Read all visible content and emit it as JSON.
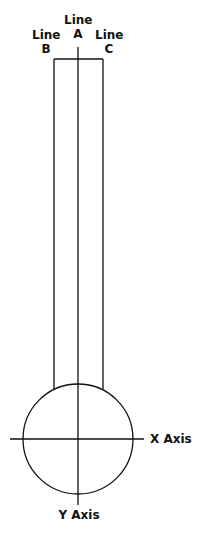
{
  "diagram": {
    "labels": {
      "line_a": {
        "line1": "Line",
        "line2": "A"
      },
      "line_b": {
        "line1": "Line",
        "line2": "B"
      },
      "line_c": {
        "line1": "Line",
        "line2": "C"
      },
      "x_axis": "X Axis",
      "y_axis": "Y Axis"
    },
    "colors": {
      "stroke": "#111111",
      "background": "#ffffff"
    }
  }
}
